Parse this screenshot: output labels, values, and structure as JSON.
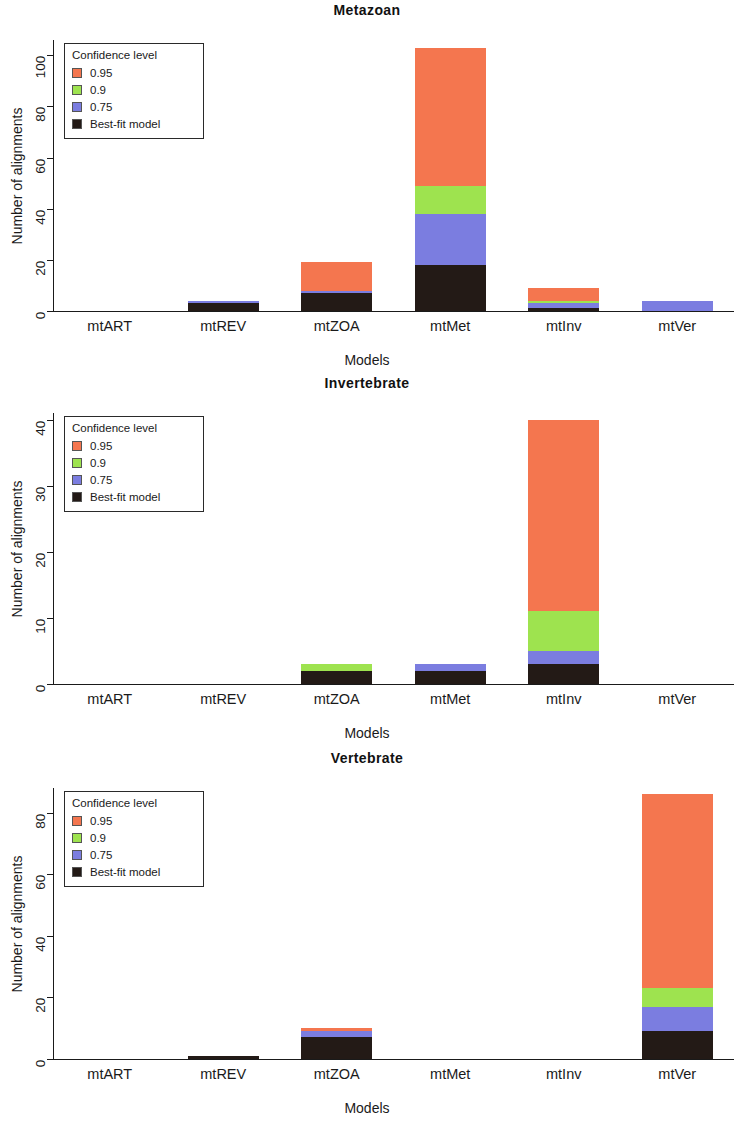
{
  "figure": {
    "panel_count": 3,
    "y_axis_label": "Number of alignments",
    "x_axis_label": "Models",
    "legend_title": "Confidence level",
    "categories": [
      "mtART",
      "mtREV",
      "mtZOA",
      "mtMet",
      "mtInv",
      "mtVer"
    ],
    "series_names": [
      "0.95",
      "0.9",
      "0.75",
      "Best-fit model"
    ],
    "colors": {
      "c095": "#f4764f",
      "c09": "#9ee34f",
      "c075": "#7b7de0",
      "best_fit": "#231a16",
      "axis": "#1a1a1a",
      "background": "#ffffff"
    }
  },
  "chart_data": [
    {
      "type": "bar",
      "stacked": true,
      "title": "Metazoan",
      "xlabel": "Models",
      "ylabel": "Number of alignments",
      "categories": [
        "mtART",
        "mtREV",
        "mtZOA",
        "mtMet",
        "mtInv",
        "mtVer"
      ],
      "ylim": [
        0,
        106
      ],
      "yticks": [
        0,
        20,
        40,
        60,
        80,
        100
      ],
      "grid": false,
      "legend_position": "top-left",
      "legend_title": "Confidence level",
      "series": [
        {
          "name": "Best-fit model",
          "color": "#231a16",
          "values": [
            0,
            3,
            7,
            18,
            1,
            0
          ]
        },
        {
          "name": "0.75",
          "color": "#7b7de0",
          "values": [
            0,
            1,
            1,
            20,
            2,
            4
          ]
        },
        {
          "name": "0.9",
          "color": "#9ee34f",
          "values": [
            0,
            0,
            0,
            11,
            1,
            0
          ]
        },
        {
          "name": "0.95",
          "color": "#f4764f",
          "values": [
            0,
            0,
            11,
            54,
            5,
            0
          ]
        }
      ],
      "totals": [
        0,
        4,
        19,
        103,
        9,
        4
      ]
    },
    {
      "type": "bar",
      "stacked": true,
      "title": "Invertebrate",
      "xlabel": "Models",
      "ylabel": "Number of alignments",
      "categories": [
        "mtART",
        "mtREV",
        "mtZOA",
        "mtMet",
        "mtInv",
        "mtVer"
      ],
      "ylim": [
        0,
        41
      ],
      "yticks": [
        0,
        10,
        20,
        30,
        40
      ],
      "grid": false,
      "legend_position": "top-left",
      "legend_title": "Confidence level",
      "series": [
        {
          "name": "Best-fit model",
          "color": "#231a16",
          "values": [
            0,
            0,
            2,
            2,
            3,
            0
          ]
        },
        {
          "name": "0.75",
          "color": "#7b7de0",
          "values": [
            0,
            0,
            0,
            1,
            2,
            0
          ]
        },
        {
          "name": "0.9",
          "color": "#9ee34f",
          "values": [
            0,
            0,
            1,
            0,
            6,
            0
          ]
        },
        {
          "name": "0.95",
          "color": "#f4764f",
          "values": [
            0,
            0,
            0,
            0,
            29,
            0
          ]
        }
      ],
      "totals": [
        0,
        0,
        3,
        3,
        40,
        0
      ]
    },
    {
      "type": "bar",
      "stacked": true,
      "title": "Vertebrate",
      "xlabel": "Models",
      "ylabel": "Number of alignments",
      "categories": [
        "mtART",
        "mtREV",
        "mtZOA",
        "mtMet",
        "mtInv",
        "mtVer"
      ],
      "ylim": [
        0,
        88
      ],
      "yticks": [
        0,
        20,
        40,
        60,
        80
      ],
      "grid": false,
      "legend_position": "top-left",
      "legend_title": "Confidence level",
      "series": [
        {
          "name": "Best-fit model",
          "color": "#231a16",
          "values": [
            0,
            1,
            7,
            0,
            0,
            9
          ]
        },
        {
          "name": "0.75",
          "color": "#7b7de0",
          "values": [
            0,
            0,
            2,
            0,
            0,
            8
          ]
        },
        {
          "name": "0.9",
          "color": "#9ee34f",
          "values": [
            0,
            0,
            0,
            0,
            0,
            6
          ]
        },
        {
          "name": "0.95",
          "color": "#f4764f",
          "values": [
            0,
            0,
            1,
            0,
            0,
            63
          ]
        }
      ],
      "totals": [
        0,
        1,
        10,
        0,
        0,
        86
      ]
    }
  ]
}
